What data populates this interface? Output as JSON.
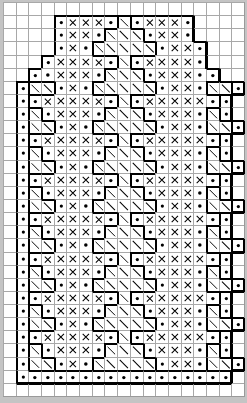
{
  "chart_data": {
    "type": "table",
    "title": "",
    "columns": 19,
    "rows": 30,
    "legend": {
      ".": "empty",
      "o": "dot (purl/bead stitch)",
      "x": "cross stitch",
      "s": "diagonal slash stitch"
    },
    "colors": {
      "background": "#ffffff",
      "grid_line": "#a8a8a8",
      "outline": "#000000",
      "symbol": "#000000",
      "frame": "#c4c4c4"
    },
    "grid": [
      "...................",
      "....oxxxosoxxxo....",
      "....oxxosssoxxo....",
      "....oxossssso xo....",
      "...oxxxxosoxxxxo...",
      "..ooxxxosssoxxxoo..",
      ".ossoxossssso xossо.",
      ".ooxxxxxosoxxxxxoo.",
      ".osoxxxosssoxxxoso.",
      ".ossoxossssso xosso.",
      ".ooxxxxxosoxxxxxoo.",
      ".osoxxxosssoxxxoso.",
      ".ossoxossssso xosso.",
      ".ooxxxxxosoxxxxxoo.",
      ".osoxxxosssoxxxoso.",
      ".ossoxossssso xosso.",
      ".ooxxxxxosoxxxxxoo.",
      ".osoxxxosssoxxxoso.",
      ".ossoxossssso xosso.",
      ".ooxxxxxosoxxxxxoo.",
      ".osoxxxosssoxxxoso.",
      ".ossoxossssso xosso.",
      ".ooxxxxxosoxxxxxoo.",
      ".osoxxxosssoxxxoso.",
      ".ossoxossssso xosso.",
      ".ooxxxxxosoxxxxxoo.",
      ".osoxxxosssoxxxoso.",
      ".ossoxossssso xosso.",
      ".ooooooooooooooooo.",
      "..................."
    ]
  }
}
